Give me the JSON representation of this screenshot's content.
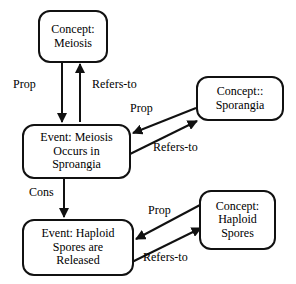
{
  "diagram": {
    "background_color": "#ffffff",
    "stroke_color": "#111111",
    "text_color": "#000000",
    "nodes": [
      {
        "id": "meiosis",
        "kind": "concept",
        "lines": [
          "Concept:",
          "Meiosis"
        ]
      },
      {
        "id": "event-meiosis",
        "kind": "event",
        "lines": [
          "Event: Meiosis",
          "Occurs in",
          "Sproangia"
        ]
      },
      {
        "id": "sporangia",
        "kind": "concept",
        "lines": [
          "Concept::",
          "Sporangia"
        ]
      },
      {
        "id": "event-spores",
        "kind": "event",
        "lines": [
          "Event: Haploid",
          "Spores are",
          "Released"
        ]
      },
      {
        "id": "haploid-spores",
        "kind": "concept",
        "lines": [
          "Concept:",
          "Haploid",
          "Spores"
        ]
      }
    ],
    "edges": [
      {
        "id": "prop-meiosis",
        "label": "Prop",
        "from": "meiosis",
        "to": "event-meiosis",
        "direction": "down"
      },
      {
        "id": "refers-meiosis",
        "label": "Refers-to",
        "from": "event-meiosis",
        "to": "meiosis",
        "direction": "up"
      },
      {
        "id": "prop-sporangia",
        "label": "Prop",
        "from": "sporangia",
        "to": "event-meiosis",
        "direction": "left"
      },
      {
        "id": "refers-sporangia",
        "label": "Refers-to",
        "from": "event-meiosis",
        "to": "sporangia",
        "direction": "right"
      },
      {
        "id": "cons",
        "label": "Cons",
        "from": "event-meiosis",
        "to": "event-spores",
        "direction": "down"
      },
      {
        "id": "prop-spores",
        "label": "Prop",
        "from": "haploid-spores",
        "to": "event-spores",
        "direction": "left"
      },
      {
        "id": "refers-spores",
        "label": "Refers-to",
        "from": "event-spores",
        "to": "haploid-spores",
        "direction": "right"
      }
    ]
  }
}
